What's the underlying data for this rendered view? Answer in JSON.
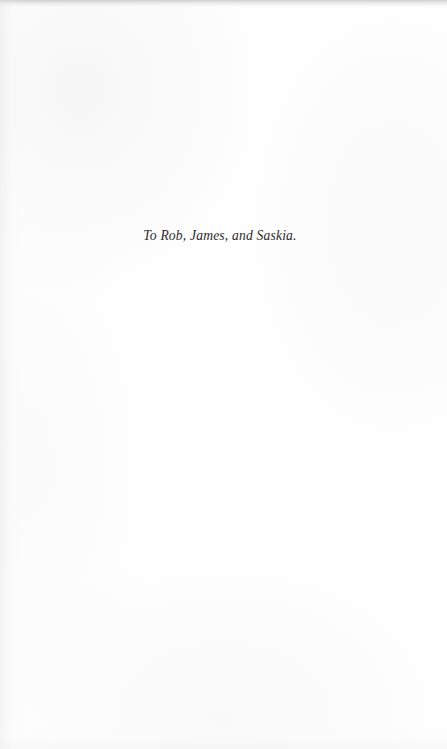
{
  "page": {
    "kind": "dedication-page",
    "paper_color": "#fefefe",
    "ink_color": "#2a2a2c"
  },
  "dedication": {
    "text": "To Rob, James, and Saskia."
  }
}
